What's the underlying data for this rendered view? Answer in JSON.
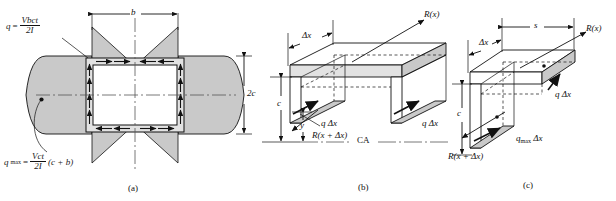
{
  "figure": {
    "background": "#ffffff",
    "fill_gray": "#c9c9c9",
    "fill_light": "#e2e2e2",
    "line_color": "#111111"
  },
  "panel_a": {
    "caption": "(a)",
    "dim_b": "b",
    "dim_2c": "2c",
    "eq_q": {
      "lhs": "q",
      "eq": "=",
      "num": "Vbct",
      "den": "2I"
    },
    "eq_qmax": {
      "lhs": "q",
      "sub": "max",
      "eq": "=",
      "num": "Vct",
      "den": "2I",
      "tail": "(c + b)"
    }
  },
  "panel_b": {
    "caption": "(b)",
    "label_dx": "Δx",
    "label_Rx": "R(x)",
    "label_qdx": "q Δx",
    "label_qdx_right": "q Δx",
    "label_Rxdx": "R(x + Δx)",
    "label_c": "c",
    "label_y": "y",
    "label_ca": "CA"
  },
  "panel_c": {
    "caption": "(c)",
    "label_dx": "Δx",
    "label_s": "s",
    "label_Rx": "R(x)",
    "label_qdx": "q Δx",
    "label_qmaxdx": "q",
    "label_qmaxdx_sub": "max",
    "label_qmaxdx_tail": "Δx",
    "label_c": "c",
    "label_Rxdx": "R(x + Δx)"
  }
}
